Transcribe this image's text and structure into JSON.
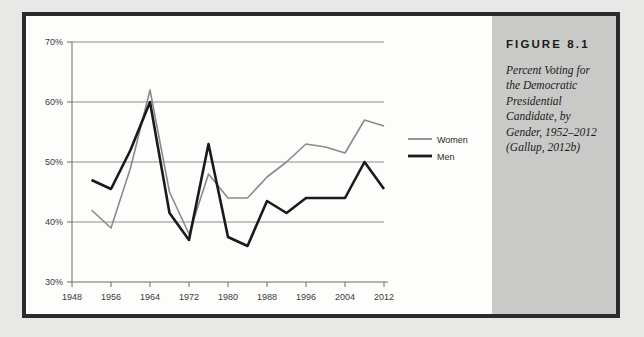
{
  "figure": {
    "number_label": "FIGURE 8.1",
    "caption": "Percent Voting for the Democratic Presidential Candidate, by Gender, 1952–2012 (Gallup, 2012b)"
  },
  "colors": {
    "women_line": "#8a8a8a",
    "men_line": "#1a1a1a",
    "gridline": "#8c8c8c",
    "panel_background": "#c9c9c7",
    "figure_border": "#2b2b2b",
    "page_background": "#e8e8e6"
  },
  "legend": {
    "position": "right",
    "entries": [
      {
        "label": "Women",
        "color": "#8a8a8a"
      },
      {
        "label": "Men",
        "color": "#1a1a1a"
      }
    ]
  },
  "axes": {
    "y_ticks": [
      "30%",
      "40%",
      "50%",
      "60%",
      "70%"
    ],
    "x_ticks": [
      "1948",
      "1956",
      "1964",
      "1972",
      "1980",
      "1988",
      "1996",
      "2004",
      "2012"
    ]
  },
  "chart_data": {
    "type": "line",
    "title": "Percent Voting for the Democratic Presidential Candidate, by Gender, 1952–2012",
    "xlabel": "",
    "ylabel": "",
    "xlim": [
      1948,
      2012
    ],
    "ylim": [
      30,
      70
    ],
    "grid": true,
    "legend_position": "right",
    "x": [
      1952,
      1956,
      1960,
      1964,
      1968,
      1972,
      1976,
      1980,
      1984,
      1988,
      1992,
      1996,
      2000,
      2004,
      2008,
      2012
    ],
    "series": [
      {
        "name": "Women",
        "color": "#8a8a8a",
        "values": [
          42,
          39,
          49,
          62,
          45,
          38,
          48,
          44,
          44,
          47.5,
          50,
          53,
          52.5,
          51.5,
          57,
          56
        ]
      },
      {
        "name": "Men",
        "color": "#1a1a1a",
        "values": [
          47,
          45.5,
          52,
          60,
          41.5,
          37,
          53,
          37.5,
          36,
          43.5,
          41.5,
          44,
          44,
          44,
          50,
          45.5
        ]
      }
    ]
  }
}
